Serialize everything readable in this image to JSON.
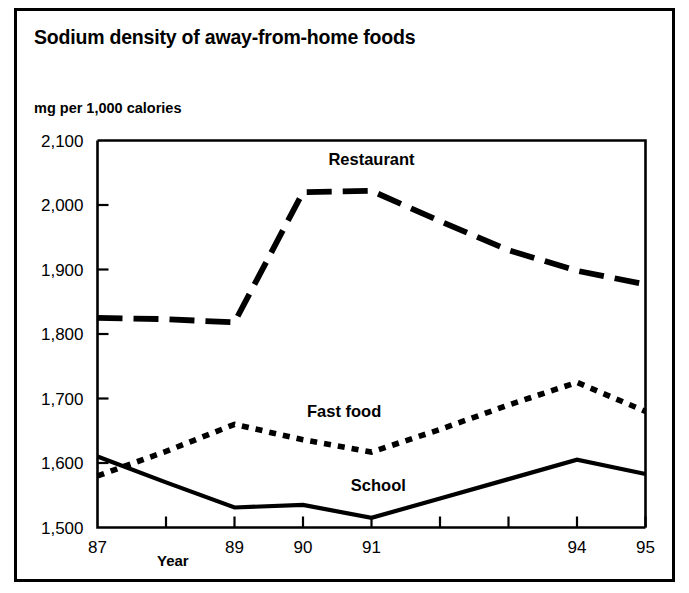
{
  "chart_data": {
    "type": "line",
    "title": "Sodium density of away-from-home foods",
    "ylabel": "mg per 1,000 calories",
    "xlabel": "Year",
    "grid": false,
    "legend_position": "inline-labels",
    "x": [
      87,
      88,
      89,
      90,
      91,
      92,
      93,
      94,
      95
    ],
    "xtick_labels": [
      "87",
      "",
      "89",
      "90",
      "91",
      "",
      "",
      "94",
      "95"
    ],
    "ytick_labels": [
      "1,500",
      "1,600",
      "1,700",
      "1,800",
      "1,900",
      "2,000",
      "2,100"
    ],
    "yticks": [
      1500,
      1600,
      1700,
      1800,
      1900,
      2000,
      2100
    ],
    "ylim": [
      1500,
      2100
    ],
    "xlim": [
      87,
      95
    ],
    "series": [
      {
        "name": "Restaurant",
        "style": "long-dash",
        "values": [
          1825,
          1823,
          1818,
          2020,
          2022,
          1975,
          1930,
          1898,
          1877
        ],
        "label_x": 91,
        "label_y": 2062
      },
      {
        "name": "Fast food",
        "style": "dotted",
        "values": [
          1580,
          1618,
          1660,
          1636,
          1617,
          1652,
          1690,
          1725,
          1680
        ],
        "label_x": 90.6,
        "label_y": 1672
      },
      {
        "name": "School",
        "style": "solid",
        "values": [
          1610,
          1570,
          1531,
          1535,
          1515,
          1545,
          1575,
          1605,
          1583
        ],
        "label_x": 91.1,
        "label_y": 1556
      }
    ]
  },
  "figure": {
    "title": "Sodium density of away-from-home foods",
    "unit_label": "mg per 1,000 calories",
    "x_axis_title": "Year"
  }
}
